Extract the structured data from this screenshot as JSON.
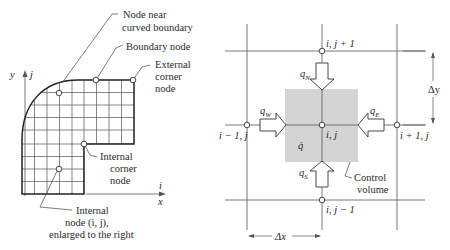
{
  "left_diagram": {
    "labels": {
      "node_near_curved_1": "Node near",
      "node_near_curved_2": "curved boundary",
      "boundary_node": "Boundary node",
      "external_corner_1": "External",
      "external_corner_2": "corner",
      "external_corner_3": "node",
      "internal_corner_1": "Internal",
      "internal_corner_2": "corner",
      "internal_corner_3": "node",
      "internal_node_1": "Internal",
      "internal_node_2": "node (i, j),",
      "internal_node_3": "enlarged to the right"
    },
    "axes": {
      "y": "y",
      "j": "j",
      "i": "i",
      "x": "x"
    }
  },
  "right_diagram": {
    "nodes": {
      "top": "i, j + 1",
      "center": "i, j",
      "left": "i − 1, j",
      "right": "i + 1, j",
      "bottom": "i, j − 1"
    },
    "fluxes": {
      "north": "q",
      "north_sub": "N",
      "south": "q",
      "south_sub": "S",
      "west": "q",
      "west_sub": "W",
      "east": "q",
      "east_sub": "E",
      "generation": "q̇"
    },
    "control_volume_1": "Control",
    "control_volume_2": "volume",
    "dx": "Δx",
    "dy": "Δy"
  },
  "colors": {
    "line": "#333333",
    "grid": "#555555",
    "shade": "#d4d4d4"
  }
}
